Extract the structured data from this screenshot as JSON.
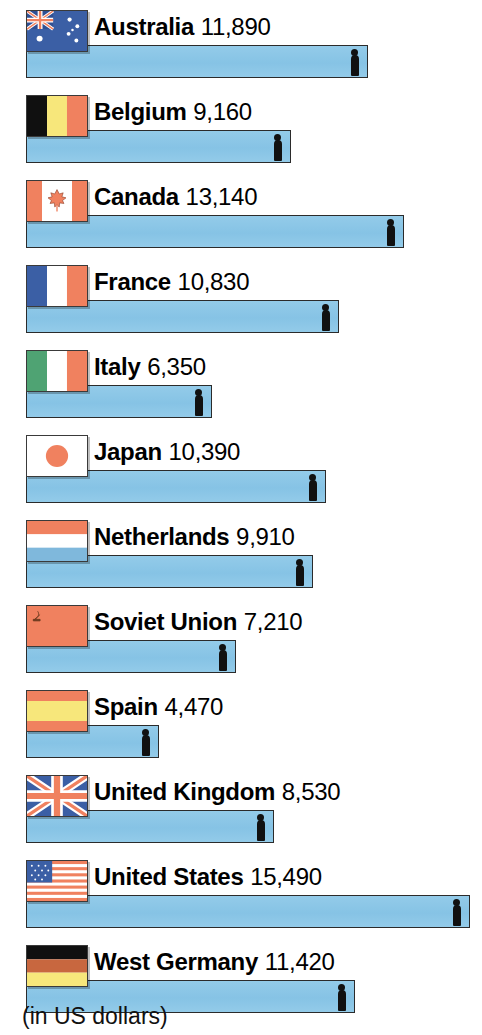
{
  "footer": {
    "note": "(in US dollars)"
  },
  "chart_data": {
    "type": "bar",
    "title": "",
    "subtitle": "",
    "xlabel": "",
    "ylabel": "",
    "units_note": "(in US dollars)",
    "orientation": "horizontal",
    "grid": false,
    "legend": false,
    "axis_range": [
      0,
      15490
    ],
    "categories": [
      "Australia",
      "Belgium",
      "Canada",
      "France",
      "Italy",
      "Japan",
      "Netherlands",
      "Soviet Union",
      "Spain",
      "United Kingdom",
      "United States",
      "West Germany"
    ],
    "values": [
      11890,
      9160,
      13140,
      10830,
      6350,
      10390,
      9910,
      7210,
      4470,
      8530,
      15490,
      11420
    ],
    "value_labels": [
      "11,890",
      "9,160",
      "13,140",
      "10,830",
      "6,350",
      "10,390",
      "9,910",
      "7,210",
      "4,470",
      "8,530",
      "15,490",
      "11,420"
    ],
    "rows": [
      {
        "country": "Australia",
        "value": 11890,
        "value_label": "11,890",
        "flag": "australia-flag"
      },
      {
        "country": "Belgium",
        "value": 9160,
        "value_label": "9,160",
        "flag": "belgium-flag"
      },
      {
        "country": "Canada",
        "value": 13140,
        "value_label": "13,140",
        "flag": "canada-flag"
      },
      {
        "country": "France",
        "value": 10830,
        "value_label": "10,830",
        "flag": "france-flag"
      },
      {
        "country": "Italy",
        "value": 6350,
        "value_label": "6,350",
        "flag": "italy-flag"
      },
      {
        "country": "Japan",
        "value": 10390,
        "value_label": "10,390",
        "flag": "japan-flag"
      },
      {
        "country": "Netherlands",
        "value": 9910,
        "value_label": "9,910",
        "flag": "netherlands-flag"
      },
      {
        "country": "Soviet Union",
        "value": 7210,
        "value_label": "7,210",
        "flag": "soviet-union-flag"
      },
      {
        "country": "Spain",
        "value": 4470,
        "value_label": "4,470",
        "flag": "spain-flag"
      },
      {
        "country": "United Kingdom",
        "value": 8530,
        "value_label": "8,530",
        "flag": "united-kingdom-flag"
      },
      {
        "country": "United States",
        "value": 15490,
        "value_label": "15,490",
        "flag": "united-states-flag"
      },
      {
        "country": "West Germany",
        "value": 11420,
        "value_label": "11,420",
        "flag": "west-germany-flag"
      }
    ]
  },
  "colors": {
    "bar_fill": "#8CC8E8",
    "bar_stroke": "#2b2b2b",
    "figure": "#111111",
    "flag_red": "#F0815F",
    "flag_blue": "#3B5FA5",
    "flag_yellow": "#F7E77B",
    "flag_green": "#4FA373",
    "flag_black": "#101010",
    "flag_white": "#FFFFFF",
    "text": "#000000",
    "background": "#FFFFFF"
  }
}
